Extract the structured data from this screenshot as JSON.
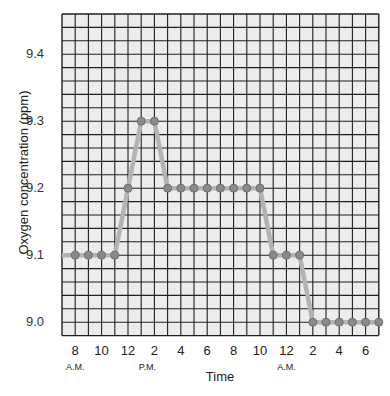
{
  "chart_data": {
    "type": "line",
    "title": "",
    "xlabel": "Time",
    "ylabel": "Oxygen concentration (ppm)",
    "ylim": [
      8.98,
      9.46
    ],
    "grid": true,
    "legend": null,
    "y_ticks": [
      "9.0",
      "9.1",
      "9.2",
      "9.3",
      "9.4"
    ],
    "x_ticks": [
      "8",
      "10",
      "12",
      "2",
      "4",
      "6",
      "8",
      "10",
      "12",
      "2",
      "4",
      "6"
    ],
    "x_sublabels": [
      {
        "label": "A.M.",
        "under": "8"
      },
      {
        "label": "P.M.",
        "under": "2"
      },
      {
        "label": "A.M.",
        "under": "12"
      }
    ],
    "x": [
      "8 A.M.",
      "9 A.M.",
      "10 A.M.",
      "11 A.M.",
      "12 P.M.",
      "1 P.M.",
      "2 P.M.",
      "3 P.M.",
      "4 P.M.",
      "5 P.M.",
      "6 P.M.",
      "7 P.M.",
      "8 P.M.",
      "9 P.M.",
      "10 P.M.",
      "11 P.M.",
      "12 A.M.",
      "1 A.M.",
      "2 A.M.",
      "3 A.M.",
      "4 A.M.",
      "5 A.M.",
      "6 A.M.",
      "7 A.M."
    ],
    "series": [
      {
        "name": "Oxygen concentration",
        "values": [
          9.1,
          9.1,
          9.1,
          9.1,
          9.2,
          9.3,
          9.3,
          9.2,
          9.2,
          9.2,
          9.2,
          9.2,
          9.2,
          9.2,
          9.2,
          9.1,
          9.1,
          9.1,
          9.0,
          9.0,
          9.0,
          9.0,
          9.0,
          9.0
        ]
      }
    ],
    "colors": {
      "line": "#b3b3b3",
      "marker_fill": "#8a8a8a",
      "marker_stroke": "#6e6e6e",
      "grid_bg": "#ececec",
      "grid_line": "#1e1e1e"
    }
  }
}
